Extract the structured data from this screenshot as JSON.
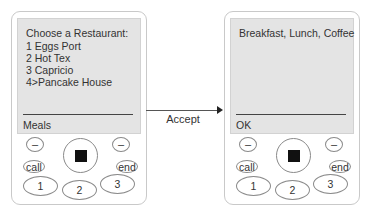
{
  "left_phone": {
    "screen": {
      "title": "Choose a Restaurant:",
      "items": [
        "1 Eggs Port",
        "2 Hot Tex",
        "3 Capricio",
        "4>Pancake House"
      ],
      "softkey_label": "Meals"
    },
    "buttons": {
      "soft_left": "–",
      "soft_right": "–",
      "call": "call",
      "end": "end",
      "keys": [
        "1",
        "2",
        "3"
      ]
    }
  },
  "transition": {
    "label": "Accept"
  },
  "right_phone": {
    "screen": {
      "title": "Breakfast, Lunch, Coffee",
      "items": [],
      "softkey_label": "OK"
    },
    "buttons": {
      "soft_left": "–",
      "soft_right": "–",
      "call": "call",
      "end": "end",
      "keys": [
        "1",
        "2",
        "3"
      ]
    }
  }
}
